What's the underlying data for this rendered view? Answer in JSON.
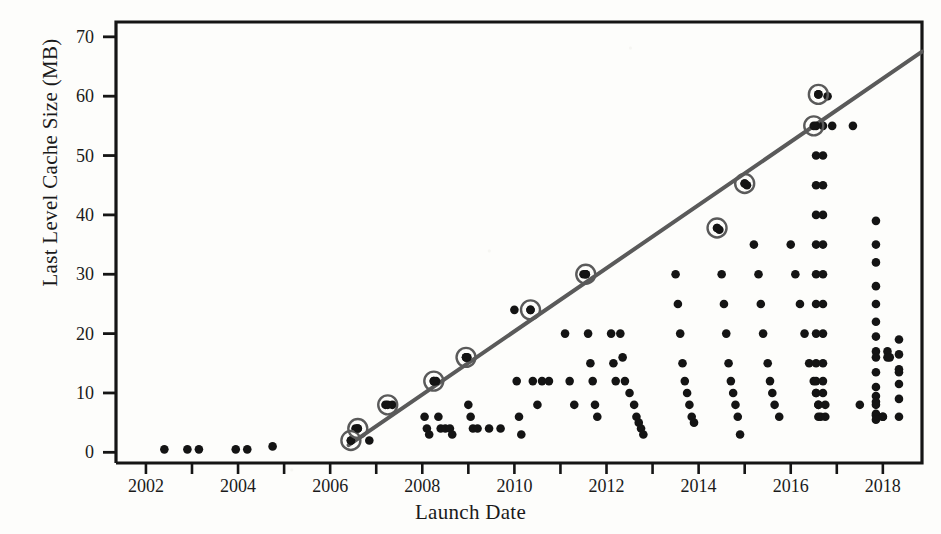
{
  "chart_data": {
    "type": "scatter",
    "title": "",
    "xlabel": "Launch Date",
    "ylabel": "Last Level Cache Size (MB)",
    "xlim": [
      2001.35,
      2018.85
    ],
    "ylim": [
      -1.8,
      72.5
    ],
    "xticks": [
      2002,
      2003,
      2004,
      2005,
      2006,
      2007,
      2008,
      2009,
      2010,
      2011,
      2012,
      2013,
      2014,
      2015,
      2016,
      2017,
      2018
    ],
    "xticklabels": [
      "2002",
      "",
      "2004",
      "",
      "2006",
      "",
      "2008",
      "",
      "2010",
      "",
      "2012",
      "",
      "2014",
      "",
      "2016",
      "",
      "2018"
    ],
    "yticks": [
      0,
      10,
      20,
      30,
      40,
      50,
      60,
      70
    ],
    "yticklabels": [
      "0",
      "10",
      "20",
      "30",
      "40",
      "50",
      "60",
      "70"
    ],
    "grid": false,
    "legend": null,
    "series": [
      {
        "name": "processors",
        "marker": "filled-circle",
        "color": "#141414",
        "points": [
          [
            2002.4,
            0.5
          ],
          [
            2002.9,
            0.5
          ],
          [
            2003.15,
            0.5
          ],
          [
            2003.95,
            0.5
          ],
          [
            2004.2,
            0.5
          ],
          [
            2004.75,
            1.0
          ],
          [
            2006.45,
            2.0
          ],
          [
            2006.55,
            4.0
          ],
          [
            2006.6,
            4.0
          ],
          [
            2006.85,
            2.0
          ],
          [
            2007.2,
            8.0
          ],
          [
            2007.35,
            8.0
          ],
          [
            2008.05,
            6.0
          ],
          [
            2008.1,
            4.0
          ],
          [
            2008.15,
            3.0
          ],
          [
            2008.25,
            12.0
          ],
          [
            2008.3,
            12.0
          ],
          [
            2008.35,
            6.0
          ],
          [
            2008.4,
            4.0
          ],
          [
            2008.5,
            4.0
          ],
          [
            2008.6,
            4.0
          ],
          [
            2008.65,
            3.0
          ],
          [
            2008.95,
            16.0
          ],
          [
            2008.98,
            16.0
          ],
          [
            2009.0,
            8.0
          ],
          [
            2009.05,
            6.0
          ],
          [
            2009.1,
            4.0
          ],
          [
            2009.2,
            4.0
          ],
          [
            2009.45,
            4.0
          ],
          [
            2009.7,
            4.0
          ],
          [
            2010.0,
            24.0
          ],
          [
            2010.05,
            12.0
          ],
          [
            2010.1,
            6.0
          ],
          [
            2010.15,
            3.0
          ],
          [
            2010.35,
            24.0
          ],
          [
            2010.4,
            12.0
          ],
          [
            2010.5,
            8.0
          ],
          [
            2010.6,
            12.0
          ],
          [
            2010.75,
            12.0
          ],
          [
            2011.1,
            20.0
          ],
          [
            2011.2,
            12.0
          ],
          [
            2011.3,
            8.0
          ],
          [
            2011.5,
            30.0
          ],
          [
            2011.55,
            30.0
          ],
          [
            2011.6,
            20.0
          ],
          [
            2011.65,
            15.0
          ],
          [
            2011.7,
            12.0
          ],
          [
            2011.75,
            8.0
          ],
          [
            2011.8,
            6.0
          ],
          [
            2012.1,
            20.0
          ],
          [
            2012.15,
            15.0
          ],
          [
            2012.2,
            12.0
          ],
          [
            2012.3,
            20.0
          ],
          [
            2012.35,
            16.0
          ],
          [
            2012.4,
            12.0
          ],
          [
            2012.5,
            10.0
          ],
          [
            2012.6,
            8.0
          ],
          [
            2012.65,
            6.0
          ],
          [
            2012.7,
            5.0
          ],
          [
            2012.75,
            4.0
          ],
          [
            2012.8,
            3.0
          ],
          [
            2013.5,
            30.0
          ],
          [
            2013.55,
            25.0
          ],
          [
            2013.6,
            20.0
          ],
          [
            2013.65,
            15.0
          ],
          [
            2013.7,
            12.0
          ],
          [
            2013.75,
            10.0
          ],
          [
            2013.8,
            8.0
          ],
          [
            2013.85,
            6.0
          ],
          [
            2013.9,
            5.0
          ],
          [
            2014.4,
            37.8
          ],
          [
            2014.45,
            37.5
          ],
          [
            2014.5,
            30.0
          ],
          [
            2014.55,
            25.0
          ],
          [
            2014.6,
            20.0
          ],
          [
            2014.65,
            15.0
          ],
          [
            2014.7,
            12.0
          ],
          [
            2014.75,
            10.0
          ],
          [
            2014.8,
            8.0
          ],
          [
            2014.85,
            6.0
          ],
          [
            2014.9,
            3.0
          ],
          [
            2015.0,
            45.3
          ],
          [
            2015.05,
            45.0
          ],
          [
            2015.2,
            35.0
          ],
          [
            2015.3,
            30.0
          ],
          [
            2015.35,
            25.0
          ],
          [
            2015.4,
            20.0
          ],
          [
            2015.5,
            15.0
          ],
          [
            2015.55,
            12.0
          ],
          [
            2015.6,
            10.0
          ],
          [
            2015.65,
            8.0
          ],
          [
            2015.75,
            6.0
          ],
          [
            2016.0,
            35.0
          ],
          [
            2016.1,
            30.0
          ],
          [
            2016.2,
            25.0
          ],
          [
            2016.3,
            20.0
          ],
          [
            2016.4,
            15.0
          ],
          [
            2016.5,
            12.0
          ],
          [
            2016.55,
            10.0
          ],
          [
            2016.6,
            8.0
          ],
          [
            2016.65,
            6.0
          ],
          [
            2016.6,
            60.3
          ],
          [
            2016.8,
            60.0
          ],
          [
            2016.55,
            55.0
          ],
          [
            2016.7,
            55.0
          ],
          [
            2016.9,
            55.0
          ],
          [
            2016.55,
            50.0
          ],
          [
            2016.7,
            50.0
          ],
          [
            2016.55,
            45.0
          ],
          [
            2016.7,
            45.0
          ],
          [
            2016.55,
            40.0
          ],
          [
            2016.7,
            40.0
          ],
          [
            2016.55,
            35.0
          ],
          [
            2016.7,
            35.0
          ],
          [
            2016.55,
            30.0
          ],
          [
            2016.7,
            30.0
          ],
          [
            2016.55,
            25.0
          ],
          [
            2016.7,
            25.0
          ],
          [
            2016.55,
            20.0
          ],
          [
            2016.7,
            20.0
          ],
          [
            2016.55,
            15.0
          ],
          [
            2016.7,
            15.0
          ],
          [
            2016.55,
            12.0
          ],
          [
            2016.7,
            12.0
          ],
          [
            2016.55,
            10.0
          ],
          [
            2016.7,
            10.0
          ],
          [
            2016.6,
            8.0
          ],
          [
            2016.75,
            8.0
          ],
          [
            2016.6,
            6.0
          ],
          [
            2016.75,
            6.0
          ],
          [
            2017.35,
            55.0
          ],
          [
            2017.5,
            8.0
          ],
          [
            2017.9,
            6.0
          ],
          [
            2018.0,
            6.0
          ],
          [
            2017.85,
            39.0
          ],
          [
            2017.85,
            35.0
          ],
          [
            2017.85,
            32.0
          ],
          [
            2017.85,
            28.0
          ],
          [
            2017.85,
            25.0
          ],
          [
            2017.85,
            22.0
          ],
          [
            2017.85,
            19.5
          ],
          [
            2017.85,
            17.0
          ],
          [
            2017.85,
            16.0
          ],
          [
            2017.85,
            13.5
          ],
          [
            2017.85,
            11.0
          ],
          [
            2017.85,
            9.5
          ],
          [
            2017.85,
            8.5
          ],
          [
            2017.85,
            8.0
          ],
          [
            2017.85,
            6.5
          ],
          [
            2017.85,
            6.2
          ],
          [
            2017.85,
            5.5
          ],
          [
            2018.1,
            17.0
          ],
          [
            2018.1,
            16.0
          ],
          [
            2018.15,
            16.0
          ],
          [
            2018.35,
            19.0
          ],
          [
            2018.35,
            16.5
          ],
          [
            2018.35,
            14.0
          ],
          [
            2018.35,
            13.5
          ],
          [
            2018.35,
            11.5
          ],
          [
            2018.35,
            9.0
          ],
          [
            2018.35,
            6.0
          ],
          [
            2018.0,
            6.0
          ]
        ]
      }
    ],
    "highlighted": {
      "name": "flagship-series",
      "marker": "circled-dot",
      "color": "#5a5a5a",
      "points": [
        [
          2006.45,
          2.0
        ],
        [
          2006.6,
          4.0
        ],
        [
          2007.25,
          8.0
        ],
        [
          2008.25,
          12.0
        ],
        [
          2008.95,
          16.0
        ],
        [
          2010.35,
          24.0
        ],
        [
          2011.55,
          30.0
        ],
        [
          2014.4,
          37.8
        ],
        [
          2015.0,
          45.3
        ],
        [
          2016.5,
          55.0
        ],
        [
          2016.6,
          60.3
        ]
      ]
    },
    "trendline": {
      "name": "flagship-trend",
      "color": "#5a5a5a",
      "width": 4,
      "x0": 2006.4,
      "y0": 1.2,
      "x1": 2018.85,
      "y1": 67.5
    }
  }
}
